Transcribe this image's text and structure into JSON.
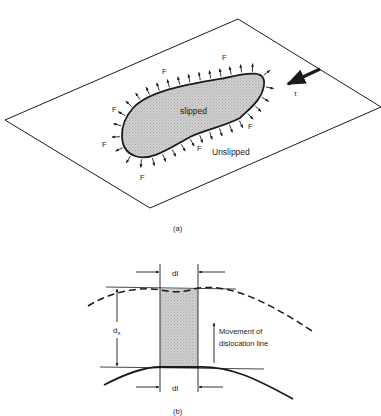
{
  "figure_a": {
    "caption": "(a)",
    "slipped_label": "slipped",
    "unslipped_label": "Unslipped",
    "force_label": "F",
    "stress_label": "τ",
    "colors": {
      "line": "#1a1a1a",
      "slipped_fill": "#c8c8c8"
    }
  },
  "figure_b": {
    "caption": "(b)",
    "segment_top_label": "dl",
    "segment_bottom_label": "dl",
    "distance_label": "d",
    "distance_subscript": "x",
    "movement_label_line1": "Movement of",
    "movement_label_line2": "dislocation line",
    "colors": {
      "line": "#1a1a1a",
      "swept_fill": "#cfcfcf"
    }
  }
}
